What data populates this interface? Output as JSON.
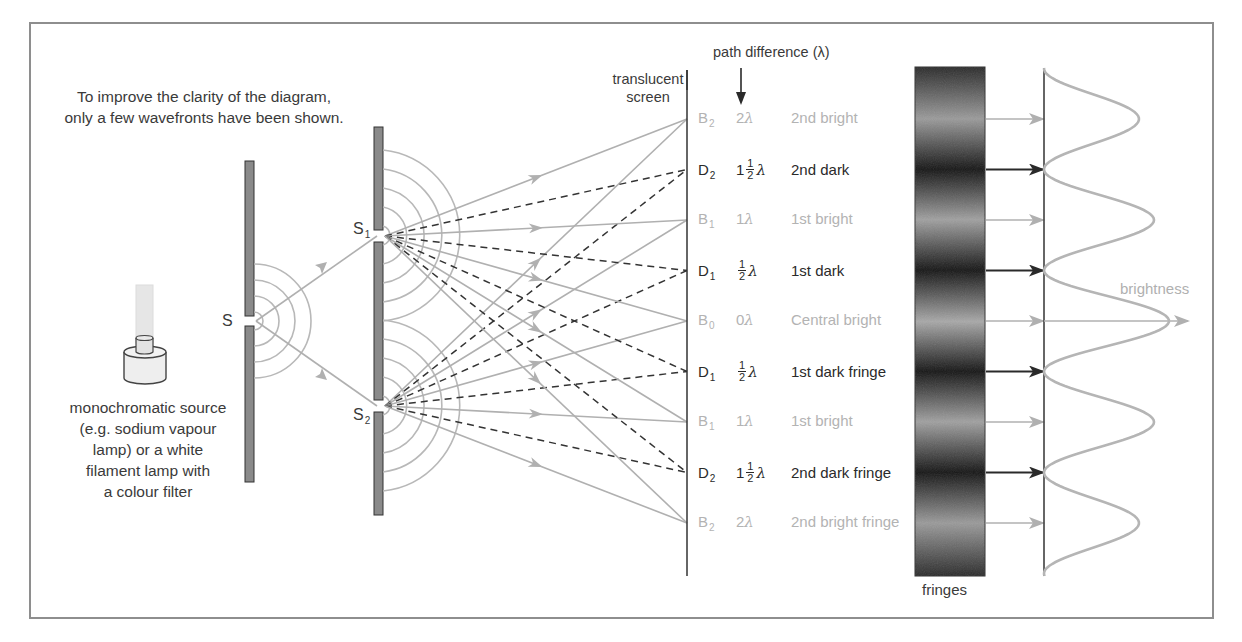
{
  "diagram": {
    "note_line1": "To improve the clarity of the diagram,",
    "note_line2": "only a few wavefronts have been shown.",
    "source": {
      "line1": "monochromatic source",
      "line2": "(e.g. sodium vapour",
      "line3": "lamp) or a white",
      "line4": "filament lamp with",
      "line5": "a colour filter"
    },
    "slit_s": "S",
    "slit_s1": "S",
    "slit_s1_sub": "1",
    "slit_s2": "S",
    "slit_s2_sub": "2",
    "screen_label_line1": "translucent",
    "screen_label_line2": "screen",
    "path_diff_label": "path difference (λ)",
    "fringes_label": "fringes",
    "brightness_label": "brightness",
    "colors": {
      "bright_ray": "#b0b0b0",
      "dark_ray": "#333333",
      "barrier_fill": "#8a8a8a",
      "frame": "#8e8e8e"
    },
    "rows": [
      {
        "letter": "B",
        "sub": "2",
        "whole": "2",
        "frac": false,
        "lambda": "λ",
        "desc": "2nd bright",
        "type": "bright"
      },
      {
        "letter": "D",
        "sub": "2",
        "whole": "1",
        "frac": true,
        "num": "1",
        "den": "2",
        "lambda": "λ",
        "desc": "2nd dark",
        "type": "dark"
      },
      {
        "letter": "B",
        "sub": "1",
        "whole": "1",
        "frac": false,
        "lambda": "λ",
        "desc": "1st bright",
        "type": "bright"
      },
      {
        "letter": "D",
        "sub": "1",
        "whole": "",
        "frac": true,
        "num": "1",
        "den": "2",
        "lambda": "λ",
        "desc": "1st dark",
        "type": "dark"
      },
      {
        "letter": "B",
        "sub": "0",
        "whole": "0",
        "frac": false,
        "lambda": "λ",
        "desc": "Central bright",
        "type": "bright"
      },
      {
        "letter": "D",
        "sub": "1",
        "whole": "",
        "frac": true,
        "num": "1",
        "den": "2",
        "lambda": "λ",
        "desc": "1st dark fringe",
        "type": "dark"
      },
      {
        "letter": "B",
        "sub": "1",
        "whole": "1",
        "frac": false,
        "lambda": "λ",
        "desc": "1st bright",
        "type": "bright"
      },
      {
        "letter": "D",
        "sub": "2",
        "whole": "1",
        "frac": true,
        "num": "1",
        "den": "2",
        "lambda": "λ",
        "desc": "2nd dark fringe",
        "type": "dark"
      },
      {
        "letter": "B",
        "sub": "2",
        "whole": "2",
        "frac": false,
        "lambda": "λ",
        "desc": "2nd bright fringe",
        "type": "bright"
      }
    ]
  }
}
